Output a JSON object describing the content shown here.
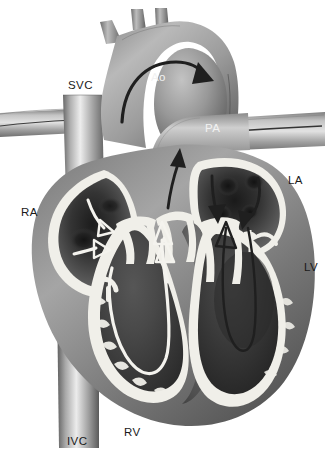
{
  "figure": {
    "background_color": "#ffffff",
    "style": "grayscale medical illustration",
    "width": 325,
    "height": 458
  },
  "palette": {
    "background": "#ffffff",
    "myocardium_light": "#b8b8b8",
    "myocardium_mid": "#8a8a8a",
    "myocardium_dark": "#5a5a5a",
    "chamber_dark": "#3d3d3d",
    "chamber_darkest": "#1f1f1f",
    "endocardium_white": "#f0efe9",
    "vessel_light": "#c9c9c9",
    "vessel_mid": "#9a9a9a",
    "arrow_dark": "#262626",
    "arrow_light": "#f4f3ee",
    "label_dark": "#1a1a1a",
    "label_light": "#f2f2f2"
  },
  "labels": [
    {
      "id": "svc",
      "text": "SVC",
      "x": 68,
      "y": 80,
      "tone": "dark",
      "meaning": "superior vena cava"
    },
    {
      "id": "ao",
      "text": "Ao",
      "x": 151,
      "y": 72,
      "tone": "light",
      "meaning": "aorta"
    },
    {
      "id": "pa",
      "text": "PA",
      "x": 205,
      "y": 123,
      "tone": "light",
      "meaning": "pulmonary artery"
    },
    {
      "id": "la",
      "text": "LA",
      "x": 288,
      "y": 175,
      "tone": "dark",
      "meaning": "left atrium"
    },
    {
      "id": "ra",
      "text": "RA",
      "x": 21,
      "y": 207,
      "tone": "dark",
      "meaning": "right atrium"
    },
    {
      "id": "lv",
      "text": "LV",
      "x": 304,
      "y": 262,
      "tone": "dark",
      "meaning": "left ventricle"
    },
    {
      "id": "rv",
      "text": "RV",
      "x": 124,
      "y": 427,
      "tone": "dark",
      "meaning": "right ventricle"
    },
    {
      "id": "ivc",
      "text": "IVC",
      "x": 67,
      "y": 436,
      "tone": "dark",
      "meaning": "inferior vena cava"
    }
  ],
  "flow_arrows": [
    {
      "id": "aortic-arch-flow",
      "tone": "dark",
      "location": "aortic arch",
      "direction": "left-to-right over the arch"
    },
    {
      "id": "ra-inflow-upper",
      "tone": "light",
      "location": "right atrium",
      "direction": "down and right"
    },
    {
      "id": "ra-inflow-lower",
      "tone": "light",
      "location": "right atrium",
      "direction": "down and right"
    },
    {
      "id": "rv-outflow",
      "tone": "light",
      "location": "right ventricle",
      "direction": "U-turn upward to pulmonary valve"
    },
    {
      "id": "pulmonary-valve-flow",
      "tone": "dark",
      "location": "pulmonary outflow tract",
      "direction": "upward"
    },
    {
      "id": "la-inflow-left",
      "tone": "dark",
      "location": "left atrium",
      "direction": "downward"
    },
    {
      "id": "la-inflow-right",
      "tone": "dark",
      "location": "left atrium",
      "direction": "down and left"
    },
    {
      "id": "lv-outflow",
      "tone": "dark",
      "location": "left ventricle",
      "direction": "U-turn upward to aortic valve"
    },
    {
      "id": "mitral-inflow",
      "tone": "light",
      "location": "mitral valve",
      "direction": "upward"
    }
  ],
  "structures": [
    {
      "id": "aortic-arch",
      "name": "Aortic arch"
    },
    {
      "id": "brachiocephalic",
      "name": "Brachiocephalic trunk"
    },
    {
      "id": "left-common-carotid",
      "name": "Left common carotid artery"
    },
    {
      "id": "left-subclavian",
      "name": "Left subclavian artery"
    },
    {
      "id": "superior-vena-cava",
      "name": "Superior vena cava"
    },
    {
      "id": "inferior-vena-cava",
      "name": "Inferior vena cava"
    },
    {
      "id": "pulmonary-artery",
      "name": "Pulmonary artery"
    },
    {
      "id": "right-atrium",
      "name": "Right atrium"
    },
    {
      "id": "left-atrium",
      "name": "Left atrium"
    },
    {
      "id": "right-ventricle",
      "name": "Right ventricle"
    },
    {
      "id": "left-ventricle",
      "name": "Left ventricle"
    },
    {
      "id": "tricuspid-valve",
      "name": "Tricuspid valve"
    },
    {
      "id": "mitral-valve",
      "name": "Mitral valve"
    },
    {
      "id": "aortic-valve",
      "name": "Aortic valve"
    },
    {
      "id": "pulmonary-valve",
      "name": "Pulmonary valve"
    },
    {
      "id": "interventricular-septum",
      "name": "Interventricular septum"
    }
  ]
}
